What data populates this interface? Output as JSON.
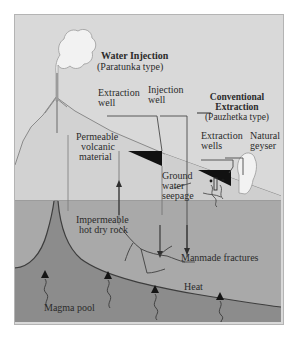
{
  "figure": {
    "domain": "geothermal-energy-schematic",
    "frame": {
      "border_color": "#b4b4b4",
      "background": "#d9d9d9"
    }
  },
  "palette": {
    "sky": "#d9d9d9",
    "permeable_volcanic": "#d2d2d2",
    "impermeable_rock": "#a9a9a9",
    "magma_pool": "#8c8c8c",
    "reservoir_wedge": "#111111",
    "steam_white": "#f2f2f2",
    "line": "#4a4a4a",
    "text": "#2b2b2b"
  },
  "labels": {
    "water_injection_title": "Water Injection",
    "water_injection_subtitle": "(Paratunka type)",
    "conventional_title_line1": "Conventional",
    "conventional_title_line2": "Extraction",
    "conventional_subtitle": "(Pauzhetka type)",
    "extraction_well_line1": "Extraction",
    "extraction_well_line2": "well",
    "injection_well_line1": "Injection",
    "injection_well_line2": "well",
    "extraction_wells_line1": "Extraction",
    "extraction_wells_line2": "wells",
    "natural_geyser_line1": "Natural",
    "natural_geyser_line2": "geyser",
    "permeable_line1": "Permeable",
    "permeable_line2": "volcanic",
    "permeable_line3": "material",
    "ground_water_line1": "Ground",
    "ground_water_line2": "water",
    "ground_water_line3": "seepage",
    "impermeable_line1": "Impermeable",
    "impermeable_line2": "hot dry rock",
    "manmade_fractures": "Manmade fractures",
    "heat": "Heat",
    "magma_pool": "Magma pool"
  },
  "icons": {
    "volcano_plume": "steam-plume-icon",
    "geyser_plume": "geyser-plume-icon",
    "heat_arrow": "heat-arrow-icon",
    "flow_arrow": "flow-arrow-icon",
    "fracture": "fracture-branch-icon"
  },
  "layers": [
    {
      "name": "permeable volcanic material",
      "kind": "upper-cone"
    },
    {
      "name": "impermeable hot dry rock",
      "kind": "mid-layer"
    },
    {
      "name": "magma pool",
      "kind": "lower-layer"
    }
  ]
}
